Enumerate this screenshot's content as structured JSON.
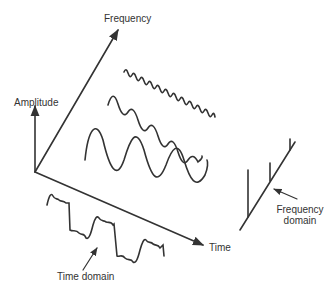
{
  "diagram": {
    "labels": {
      "frequency_axis": "Frequency",
      "amplitude_axis": "Amplitude",
      "time_axis": "Time",
      "time_domain": "Time domain",
      "frequency_domain_line1": "Frequency",
      "frequency_domain_line2": "domain"
    },
    "colors": {
      "stroke": "#333333",
      "text": "#333333",
      "background": "#ffffff"
    },
    "components": [
      {
        "name": "low-frequency-sine",
        "relative_frequency": "low",
        "relative_amplitude": "large"
      },
      {
        "name": "mid-frequency-sine",
        "relative_frequency": "medium",
        "relative_amplitude": "medium"
      },
      {
        "name": "high-frequency-sine",
        "relative_frequency": "high",
        "relative_amplitude": "small"
      }
    ]
  }
}
